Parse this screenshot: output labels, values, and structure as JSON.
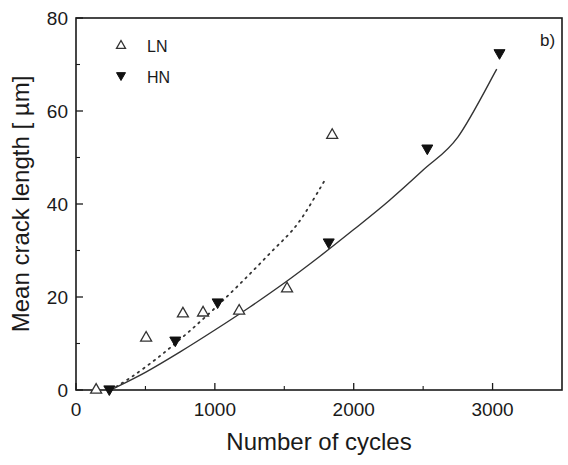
{
  "chart_data": {
    "type": "scatter",
    "title": "",
    "panel_label": "b)",
    "xlabel": "Number of cycles",
    "ylabel": "Mean crack length [ µm]",
    "xlim": [
      0,
      3500
    ],
    "ylim": [
      0,
      80
    ],
    "xticks": [
      0,
      1000,
      2000,
      3000
    ],
    "xtick_labels": [
      "0",
      "1000",
      "2000",
      "3000"
    ],
    "yticks": [
      0,
      20,
      40,
      60,
      80
    ],
    "ytick_labels": [
      "0",
      "20",
      "40",
      "60",
      "80"
    ],
    "grid": false,
    "legend_position": "upper left",
    "series": [
      {
        "name": "LN",
        "marker": "open-triangle-up",
        "x": [
          145,
          505,
          770,
          915,
          1175,
          1520,
          1845
        ],
        "y": [
          0.2,
          11.4,
          16.6,
          16.8,
          17.2,
          22,
          55
        ]
      },
      {
        "name": "HN",
        "marker": "filled-triangle-down",
        "x": [
          240,
          715,
          1020,
          1820,
          2530,
          3050
        ],
        "y": [
          0,
          10.5,
          18.7,
          31.6,
          51.8,
          72.3
        ]
      }
    ],
    "fits": [
      {
        "name": "LN fit",
        "style": "dotted",
        "x": [
          250,
          400,
          600,
          800,
          1000,
          1200,
          1400,
          1600,
          1800
        ],
        "y": [
          0,
          2.8,
          7.2,
          12.2,
          17.6,
          23.4,
          29.5,
          35.9,
          45.5
        ]
      },
      {
        "name": "HN fit",
        "style": "solid",
        "x": [
          250,
          500,
          750,
          1000,
          1250,
          1500,
          1750,
          2000,
          2250,
          2500,
          2750,
          3030
        ],
        "y": [
          0,
          3.8,
          8.2,
          12.9,
          17.8,
          23.0,
          28.6,
          34.5,
          40.6,
          47.3,
          54.4,
          69
        ]
      }
    ]
  }
}
